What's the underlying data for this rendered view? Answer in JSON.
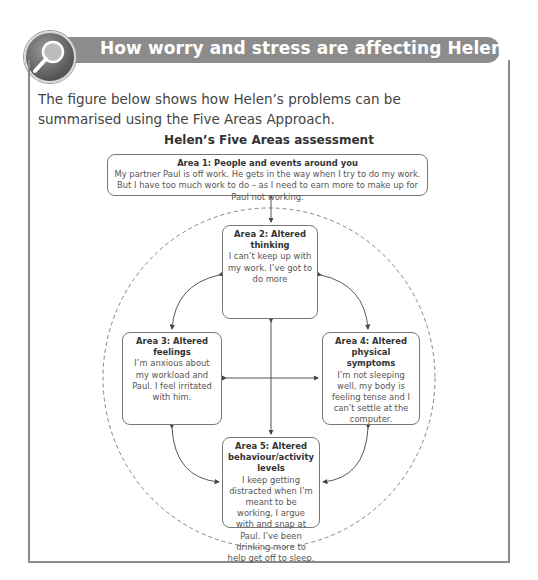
{
  "header": {
    "icon": "magnifying-glass-icon",
    "title": "How worry and stress are affecting Helen’s life"
  },
  "intro": {
    "text": "The figure below shows how Helen’s problems can be summarised using the Five Areas Approach."
  },
  "figure": {
    "title": "Helen’s Five Areas assessment",
    "areas": [
      {
        "heading": "Area 1: People and events around you",
        "text": "My partner Paul is off work. He gets in the way when I try to do my work. But I have too much work to do – as I need to earn more to make up for Paul not working."
      },
      {
        "heading": "Area 2: Altered thinking",
        "text": "I can’t keep up with my work. I’ve got to do more"
      },
      {
        "heading": "Area 3: Altered feelings",
        "text": "I’m anxious about my workload and Paul. I feel irritated with him."
      },
      {
        "heading": "Area 4: Altered physical symptoms",
        "text": "I’m not sleeping well, my body is feeling tense and I can’t settle at the computer."
      },
      {
        "heading": "Area 5: Altered behaviour/activity levels",
        "text": "I keep getting distracted when I’m meant to be working, I argue with and snap at Paul. I’ve been drinking more to help get off to sleep."
      }
    ]
  }
}
